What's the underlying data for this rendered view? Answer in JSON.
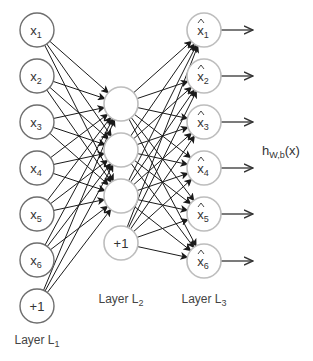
{
  "colors": {
    "edge": "#1a1a1a",
    "input_node_stroke": "#6e6e6e",
    "hidden_node_stroke": "#bdbdbd",
    "output_node_stroke": "#bdbdbd",
    "text": "#333333"
  },
  "layers": [
    {
      "id": "L1",
      "label": "Layer L",
      "label_sub": "1",
      "nodes": [
        {
          "text": "x",
          "sub": "1",
          "hat": false
        },
        {
          "text": "x",
          "sub": "2",
          "hat": false
        },
        {
          "text": "x",
          "sub": "3",
          "hat": false
        },
        {
          "text": "x",
          "sub": "4",
          "hat": false
        },
        {
          "text": "x",
          "sub": "5",
          "hat": false
        },
        {
          "text": "x",
          "sub": "6",
          "hat": false
        },
        {
          "text": "+1",
          "sub": "",
          "hat": false,
          "bias": true
        }
      ]
    },
    {
      "id": "L2",
      "label": "Layer L",
      "label_sub": "2",
      "nodes": [
        {
          "text": "",
          "sub": ""
        },
        {
          "text": "",
          "sub": ""
        },
        {
          "text": "",
          "sub": ""
        },
        {
          "text": "+1",
          "sub": "",
          "bias": true
        }
      ]
    },
    {
      "id": "L3",
      "label": "Layer L",
      "label_sub": "3",
      "nodes": [
        {
          "text": "x",
          "sub": "1",
          "hat": true
        },
        {
          "text": "x",
          "sub": "2",
          "hat": true
        },
        {
          "text": "x",
          "sub": "3",
          "hat": true
        },
        {
          "text": "x",
          "sub": "4",
          "hat": true
        },
        {
          "text": "x",
          "sub": "5",
          "hat": true
        },
        {
          "text": "x",
          "sub": "6",
          "hat": true
        }
      ]
    }
  ],
  "output_label": {
    "text": "h",
    "sub": "W,b",
    "suffix": "(x)"
  }
}
